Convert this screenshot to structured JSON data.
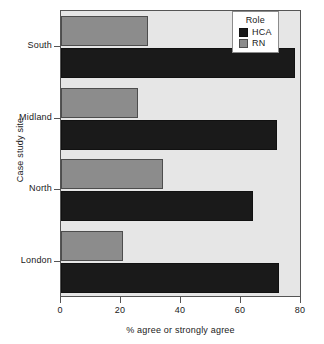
{
  "chart_data": {
    "type": "bar",
    "orientation": "horizontal",
    "title": "",
    "xlabel": "% agree or strongly agree",
    "ylabel": "Case study site",
    "categories": [
      "South",
      "Midland",
      "North",
      "London"
    ],
    "series": [
      {
        "name": "HCA",
        "color": "#1a1a1a",
        "values": [
          78,
          72,
          64,
          72.5
        ]
      },
      {
        "name": "RN",
        "color": "#8c8c8c",
        "values": [
          29,
          25.5,
          34,
          20.5
        ]
      }
    ],
    "xlim": [
      0,
      80
    ],
    "xticks": [
      0,
      20,
      40,
      60,
      80
    ],
    "xtick_labels": [
      "0",
      "20",
      "40",
      "60",
      "80"
    ],
    "grid": false,
    "legend": {
      "title": "Role",
      "position": "top-right",
      "entries": [
        {
          "label": "HCA",
          "color": "#1a1a1a"
        },
        {
          "label": "RN",
          "color": "#8c8c8c"
        }
      ]
    },
    "panel_background": "#e6e6e6",
    "frame_color": "#555555"
  }
}
